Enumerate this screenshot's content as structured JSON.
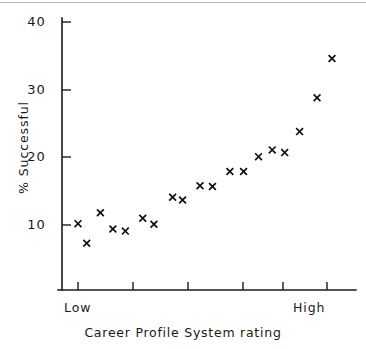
{
  "chart_data": {
    "type": "scatter",
    "title": "",
    "xlabel": "Career Profile System rating",
    "ylabel": "% Successful",
    "xlim": [
      0,
      23
    ],
    "ylim": [
      5,
      42
    ],
    "grid": false,
    "legend": null,
    "marker": "x",
    "marker_color": "#111111",
    "y_ticks": [
      10,
      20,
      30,
      40
    ],
    "y_tick_labels": [
      "10",
      "20",
      "30",
      "40"
    ],
    "x_tick_positions": [
      1,
      5,
      9,
      13,
      17,
      21
    ],
    "x_tick_labels": [
      "",
      "",
      "",
      "",
      "",
      ""
    ],
    "x_category_labels": [
      {
        "text": "Low",
        "at": 1
      },
      {
        "text": "High",
        "at": 21
      }
    ],
    "x": [
      1,
      2,
      3,
      4,
      5,
      6,
      7,
      8,
      9,
      10,
      11,
      12,
      13,
      14,
      15,
      16,
      17,
      18,
      19,
      20,
      21
    ],
    "y": [
      10.2,
      7.3,
      11.8,
      9.4,
      9.1,
      11.0,
      10.1,
      14.1,
      13.7,
      15.8,
      15.7,
      17.9,
      17.9,
      20.1,
      21.1,
      20.7,
      23.8,
      28.8,
      34.6,
      0,
      0
    ],
    "points": [
      {
        "x": 1.0,
        "y": 10.2
      },
      {
        "x": 1.7,
        "y": 7.3
      },
      {
        "x": 2.8,
        "y": 11.8
      },
      {
        "x": 3.8,
        "y": 9.4
      },
      {
        "x": 4.8,
        "y": 9.1
      },
      {
        "x": 6.2,
        "y": 11.0
      },
      {
        "x": 7.1,
        "y": 10.1
      },
      {
        "x": 8.6,
        "y": 14.1
      },
      {
        "x": 9.4,
        "y": 13.7
      },
      {
        "x": 10.8,
        "y": 15.8
      },
      {
        "x": 11.8,
        "y": 15.7
      },
      {
        "x": 13.2,
        "y": 17.9
      },
      {
        "x": 14.3,
        "y": 17.9
      },
      {
        "x": 15.5,
        "y": 20.1
      },
      {
        "x": 16.6,
        "y": 21.1
      },
      {
        "x": 17.6,
        "y": 20.7
      },
      {
        "x": 18.8,
        "y": 23.8
      },
      {
        "x": 20.2,
        "y": 28.8
      },
      {
        "x": 21.4,
        "y": 34.6
      }
    ],
    "n_points": 19,
    "trend": "increasing"
  }
}
